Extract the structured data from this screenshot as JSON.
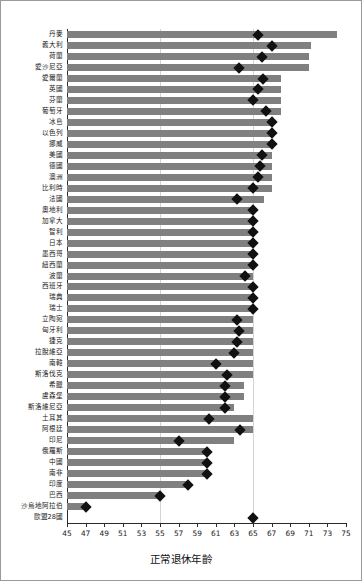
{
  "chart_data": {
    "type": "bar",
    "title": "",
    "subtitle": "",
    "xlabel": "正常退休年齡",
    "ylabel": "",
    "xlim": [
      45,
      75
    ],
    "xticks": [
      45,
      47,
      49,
      51,
      53,
      55,
      57,
      59,
      61,
      63,
      65,
      67,
      69,
      71,
      73,
      75
    ],
    "gridlines": [
      55,
      65
    ],
    "grid": true,
    "legend": null,
    "orientation": "horizontal",
    "bar_color": "#808080",
    "marker_color": "#111111",
    "marker_shape": "diamond",
    "baseline": 45,
    "categories": [
      "丹麥",
      "義大利",
      "荷蘭",
      "愛沙尼亞",
      "愛爾蘭",
      "英國",
      "芬蘭",
      "葡萄牙",
      "冰島",
      "以色列",
      "挪威",
      "美國",
      "德國",
      "澳洲",
      "比利時",
      "法國",
      "奧地利",
      "加拿大",
      "智利",
      "日本",
      "墨西哥",
      "紐西蘭",
      "波蘭",
      "西班牙",
      "瑞典",
      "瑞士",
      "立陶宛",
      "匈牙利",
      "捷克",
      "拉脫維亞",
      "南韓",
      "斯洛伐克",
      "希臘",
      "盧森堡",
      "斯洛維尼亞",
      "土耳其",
      "阿根廷",
      "印尼",
      "俄羅斯",
      "中國",
      "南非",
      "印度",
      "巴西",
      "沙烏地阿拉伯",
      "歐盟28國"
    ],
    "series": [
      {
        "name": "bar",
        "values": [
          74.0,
          71.2,
          71.0,
          71.0,
          68.0,
          68.0,
          68.0,
          68.0,
          67.0,
          67.0,
          67.0,
          67.0,
          67.0,
          67.0,
          67.0,
          66.2,
          65.0,
          65.0,
          65.0,
          65.0,
          65.0,
          65.0,
          65.0,
          65.0,
          65.0,
          65.0,
          65.0,
          65.0,
          65.0,
          65.0,
          65.0,
          65.0,
          64.0,
          64.0,
          63.0,
          65.0,
          65.0,
          63.0,
          60.0,
          60.0,
          60.0,
          58.0,
          55.0,
          47.0,
          null
        ]
      },
      {
        "name": "marker",
        "values": [
          65.5,
          67.0,
          66.0,
          63.5,
          66.1,
          65.5,
          65.0,
          66.4,
          67.0,
          67.0,
          67.0,
          66.0,
          65.7,
          65.5,
          65.0,
          63.3,
          65.0,
          65.0,
          65.0,
          65.0,
          65.0,
          65.0,
          64.1,
          65.0,
          65.0,
          65.0,
          63.3,
          63.5,
          63.3,
          63.0,
          61.0,
          62.2,
          62.0,
          62.0,
          62.0,
          60.3,
          63.6,
          57.0,
          60.0,
          60.0,
          60.0,
          58.0,
          55.0,
          47.0,
          65.0
        ]
      }
    ]
  }
}
